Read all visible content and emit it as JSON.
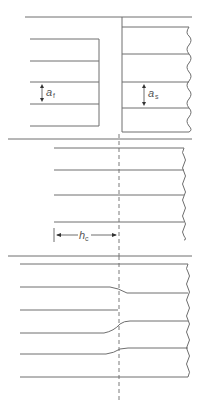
{
  "figure": {
    "panels": [
      {
        "id": "top",
        "left_block": {
          "label": "a",
          "subscript": "f",
          "description": "Layered block with spacing a_f"
        },
        "right_block": {
          "label": "a",
          "subscript": "s",
          "description": "Layered block with spacing a_s, wavy right edge"
        }
      },
      {
        "id": "middle",
        "dimension": {
          "label": "h",
          "subscript": "c",
          "description": "Distance from left edge to dashed centerline"
        }
      },
      {
        "id": "bottom",
        "description": "Joined layers with transitions at dashed centerline"
      }
    ],
    "colors": {
      "line": "#6e6e6e",
      "text": "#555555",
      "background": "#ffffff"
    }
  }
}
